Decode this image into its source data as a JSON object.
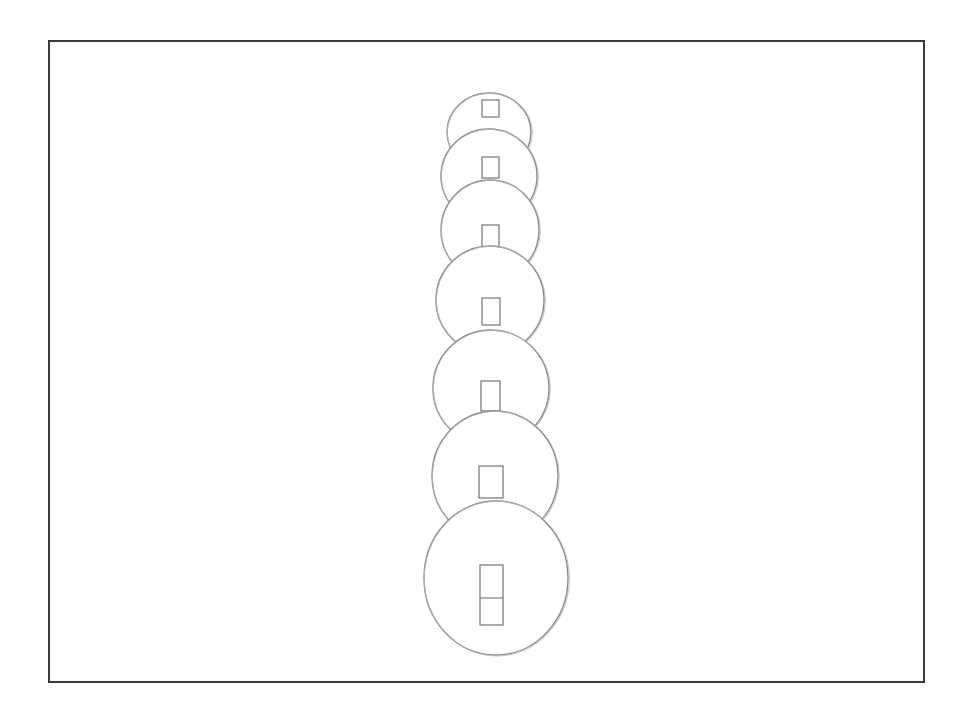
{
  "drawing": {
    "title": "",
    "medium": "pencil sketch",
    "background": "#ffffff",
    "frame": {
      "color": "#3a3a3a",
      "x": 48,
      "y": 40,
      "width": 875,
      "height": 641
    },
    "stroke_color": "#8a8a8a",
    "discs": [
      {
        "index": 1,
        "cx": 489,
        "cy": 132,
        "rx": 42,
        "ry": 39,
        "hole": {
          "x": 482,
          "y": 100,
          "w": 17,
          "h": 17,
          "split": false
        }
      },
      {
        "index": 2,
        "cx": 489,
        "cy": 176,
        "rx": 48,
        "ry": 47,
        "hole": {
          "x": 482,
          "y": 157,
          "w": 17,
          "h": 21,
          "split": false
        }
      },
      {
        "index": 3,
        "cx": 490,
        "cy": 230,
        "rx": 49,
        "ry": 50,
        "hole": {
          "x": 482,
          "y": 225,
          "w": 17,
          "h": 22,
          "split": false
        }
      },
      {
        "index": 4,
        "cx": 490,
        "cy": 300,
        "rx": 54,
        "ry": 54,
        "hole": {
          "x": 482,
          "y": 298,
          "w": 18,
          "h": 27,
          "split": false
        }
      },
      {
        "index": 5,
        "cx": 491,
        "cy": 388,
        "rx": 58,
        "ry": 58,
        "hole": {
          "x": 481,
          "y": 381,
          "w": 19,
          "h": 30,
          "split": false
        }
      },
      {
        "index": 6,
        "cx": 495,
        "cy": 476,
        "rx": 63,
        "ry": 65,
        "hole": {
          "x": 479,
          "y": 466,
          "w": 24,
          "h": 32,
          "split": false
        }
      },
      {
        "index": 7,
        "cx": 496,
        "cy": 578,
        "rx": 72,
        "ry": 77,
        "hole": {
          "x": 480,
          "y": 565,
          "w": 23,
          "h": 60,
          "split": true,
          "split_y": 598
        }
      }
    ]
  }
}
